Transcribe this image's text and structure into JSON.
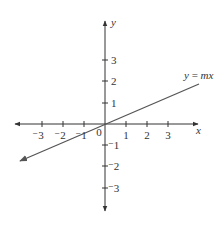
{
  "diagram": {
    "type": "coordinate-plane",
    "colors": {
      "axis": "#333333",
      "line": "#555555",
      "background": "#ffffff"
    },
    "axes": {
      "x_label": "x",
      "y_label": "y",
      "origin_label": "0",
      "x_ticks": [
        {
          "value": -3,
          "label": "⁻3",
          "px": 42
        },
        {
          "value": -2,
          "label": "⁻2",
          "px": 63
        },
        {
          "value": -1,
          "label": "⁻1",
          "px": 84
        },
        {
          "value": 1,
          "label": "1",
          "px": 126
        },
        {
          "value": 2,
          "label": "2",
          "px": 147
        },
        {
          "value": 3,
          "label": "3",
          "px": 168
        }
      ],
      "y_ticks": [
        {
          "value": 3,
          "label": "3",
          "py": 60
        },
        {
          "value": 2,
          "label": "2",
          "py": 81
        },
        {
          "value": 1,
          "label": "1",
          "py": 103
        },
        {
          "value": -1,
          "label": "⁻1",
          "py": 145
        },
        {
          "value": -2,
          "label": "⁻2",
          "py": 166
        },
        {
          "value": -3,
          "label": "⁻3",
          "py": 188
        }
      ]
    },
    "line": {
      "label": "y = mx",
      "label_parts": {
        "lhs": "y",
        "eq": " = ",
        "rhs": "mx"
      },
      "slope_approx": 0.43
    }
  }
}
